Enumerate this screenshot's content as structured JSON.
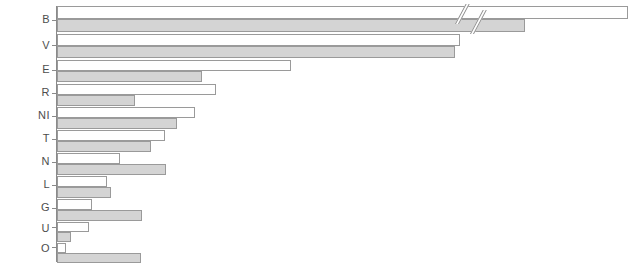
{
  "chart_data": {
    "type": "bar",
    "orientation": "horizontal",
    "title": "",
    "subtitle": "",
    "xlabel": "",
    "ylabel": "",
    "grid": false,
    "legend_position": "none",
    "axis_break": {
      "present": true,
      "series": "white",
      "category": "B",
      "note": "double-slash break on the topmost pair of bars"
    },
    "categories": [
      "B",
      "V",
      "E",
      "R",
      "NI",
      "T",
      "N",
      "L",
      "G",
      "U",
      "O"
    ],
    "series": [
      {
        "name": "white",
        "fill": "#ffffff",
        "values": [
          100.0,
          70.5,
          41.0,
          27.8,
          24.1,
          19.0,
          11.0,
          8.8,
          6.2,
          5.6,
          1.6
        ]
      },
      {
        "name": "gray",
        "fill": "#d4d4d4",
        "values": [
          82.0,
          69.7,
          25.4,
          13.6,
          21.1,
          16.4,
          19.1,
          9.5,
          14.8,
          2.4,
          14.7
        ]
      }
    ],
    "xlim": [
      0,
      100
    ],
    "tick_labels": [],
    "annotations": []
  },
  "colors": {
    "bar_white_fill": "#ffffff",
    "bar_gray_fill": "#d4d4d4",
    "bar_stroke": "#9a9a9a",
    "axis": "#8a8a8a",
    "label_text": "#4d4d4d",
    "background": "#ffffff"
  }
}
